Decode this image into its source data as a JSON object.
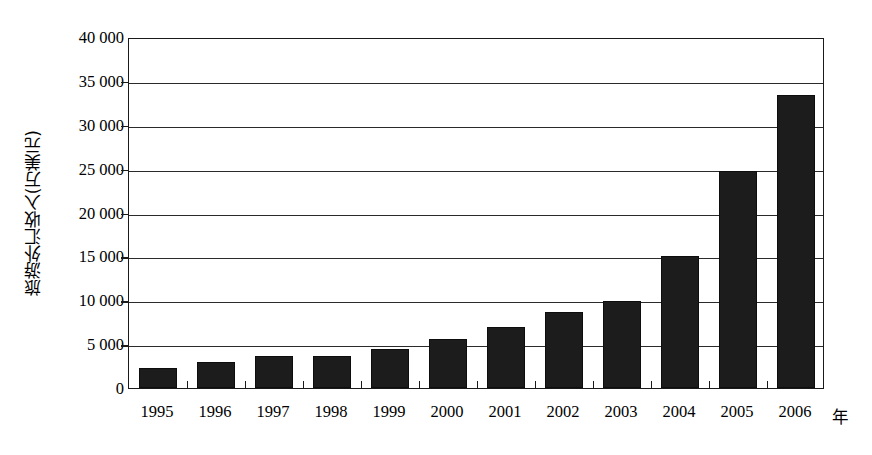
{
  "chart_data": {
    "type": "bar",
    "title": "",
    "xlabel": "年",
    "ylabel": "旅游外汇收入(万美元)",
    "categories": [
      "1995",
      "1996",
      "1997",
      "1998",
      "1999",
      "2000",
      "2001",
      "2002",
      "2003",
      "2004",
      "2005",
      "2006"
    ],
    "values": [
      2280,
      3000,
      3600,
      3700,
      4450,
      5600,
      7000,
      8700,
      9900,
      15000,
      24700,
      33400
    ],
    "ylim": [
      0,
      40000
    ],
    "ytick_values": [
      0,
      5000,
      10000,
      15000,
      20000,
      25000,
      30000,
      35000,
      40000
    ],
    "ytick_labels": [
      "0",
      "5 000",
      "10 000",
      "15 000",
      "20 000",
      "25 000",
      "30 000",
      "35 000",
      "40 000"
    ],
    "grid": true,
    "legend": null,
    "bar_color": "#1c1c1c",
    "axis_color": "#1a1a1a",
    "background": "#ffffff"
  }
}
